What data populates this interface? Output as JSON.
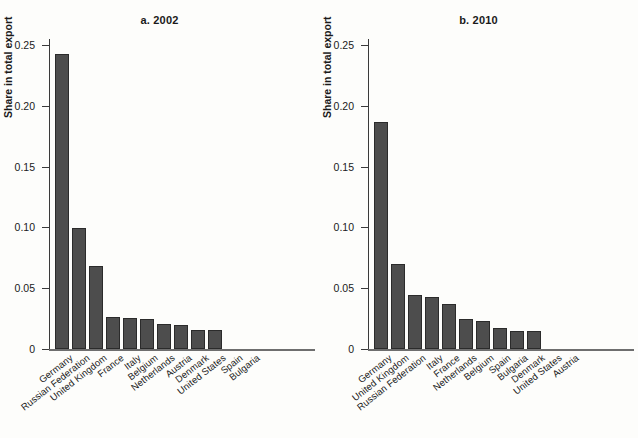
{
  "figure": {
    "ylabel": "Share in total export",
    "yticks": [
      "0",
      "0.05",
      "0.10",
      "0.15",
      "0.20",
      "0.25"
    ]
  },
  "chart_data": [
    {
      "type": "bar",
      "title": "a. 2002",
      "xlabel": "",
      "ylabel": "Share in total export",
      "ylim": [
        0,
        0.25
      ],
      "yticks": [
        0,
        0.05,
        0.1,
        0.15,
        0.2,
        0.25
      ],
      "grid": false,
      "legend": "none",
      "categories": [
        "Germany",
        "Russian Federation",
        "United Kingdom",
        "France",
        "Italy",
        "Belgium",
        "Netherlands",
        "Austria",
        "Denmark",
        "United States",
        "Spain",
        "Bulgaria"
      ],
      "values": [
        0.243,
        0.0995,
        0.0685,
        0.0265,
        0.0252,
        0.0243,
        0.0203,
        0.0199,
        0.0158,
        0.0153,
        0.0,
        0.0
      ]
    },
    {
      "type": "bar",
      "title": "b. 2010",
      "xlabel": "",
      "ylabel": "Share in total export",
      "ylim": [
        0,
        0.25
      ],
      "yticks": [
        0,
        0.05,
        0.1,
        0.15,
        0.2,
        0.25
      ],
      "grid": false,
      "legend": "none",
      "categories": [
        "Germany",
        "United Kingdom",
        "Russian Federation",
        "Italy",
        "France",
        "Netherlands",
        "Belgium",
        "Spain",
        "Bulgaria",
        "Denmark",
        "United States",
        "Austria"
      ],
      "values": [
        0.187,
        0.0702,
        0.0447,
        0.0428,
        0.0372,
        0.0245,
        0.023,
        0.0175,
        0.0152,
        0.015,
        0.0,
        0.0
      ]
    }
  ]
}
